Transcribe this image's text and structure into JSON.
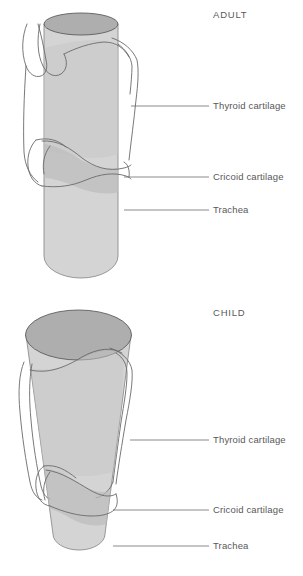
{
  "figure": {
    "background_color": "#ffffff",
    "line_color": "#6a6a6c",
    "text_color": "#58585a"
  },
  "palette": {
    "tube_body_fill": "#d4d4d4",
    "tube_top_fill": "#aeaeae",
    "cartilage_overlap_fill": "#bcbcbc",
    "cartilage_outline": "#6a6a6c",
    "leader_line": "#6d6d6f"
  },
  "panels": [
    {
      "id": "adult",
      "heading": "ADULT",
      "heading_position": {
        "x": 213,
        "y": 18
      },
      "shape_description": "straight cylindrical airway of uniform width",
      "callouts": [
        {
          "label": "Thyroid cartilage",
          "text_x": 213,
          "text_y": 109,
          "line_x1": 131,
          "line_x2": 209,
          "line_y": 106
        },
        {
          "label": "Cricoid cartilage",
          "text_x": 213,
          "text_y": 180,
          "line_x1": 124,
          "line_x2": 209,
          "line_y": 177
        },
        {
          "label": "Trachea",
          "text_x": 213,
          "text_y": 213,
          "line_x1": 124,
          "line_x2": 209,
          "line_y": 210
        }
      ]
    },
    {
      "id": "child",
      "heading": "CHILD",
      "heading_position": {
        "x": 213,
        "y": 316
      },
      "shape_description": "funnel-shaped airway narrowing toward the cricoid ring",
      "callouts": [
        {
          "label": "Thyroid cartilage",
          "text_x": 213,
          "text_y": 443,
          "line_x1": 130,
          "line_x2": 209,
          "line_y": 440
        },
        {
          "label": "Cricoid cartilage",
          "text_x": 213,
          "text_y": 513,
          "line_x1": 113,
          "line_x2": 209,
          "line_y": 510
        },
        {
          "label": "Trachea",
          "text_x": 213,
          "text_y": 549,
          "line_x1": 113,
          "line_x2": 209,
          "line_y": 546
        }
      ]
    }
  ]
}
